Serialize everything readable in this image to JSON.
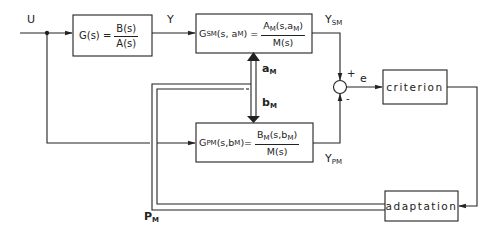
{
  "diagram": {
    "type": "block-diagram",
    "signals": {
      "input": "U",
      "plant_output": "Y",
      "sm_output_main": "Y",
      "sm_output_sub": "SM",
      "pm_output_main": "Y",
      "pm_output_sub": "PM",
      "error": "e",
      "param_a_main": "a",
      "param_a_sub": "M",
      "param_b_main": "b",
      "param_b_sub": "M",
      "param_p_main": "P",
      "param_p_sub": "M",
      "sum_plus": "+",
      "sum_minus": "-"
    },
    "blocks": {
      "plant": {
        "lhs": "G(s) =",
        "num": "B(s)",
        "den": "A(s)"
      },
      "series_model": {
        "lhs_main": "G",
        "lhs_sub": "SM",
        "lhs_args_pre": "(s, a",
        "lhs_args_sub": "M",
        "lhs_args_post": ") =",
        "num_main": "A",
        "num_sub": "M",
        "num_args_pre": "(s,a",
        "num_args_sub": "M",
        "num_args_post": ")",
        "den": "M(s)"
      },
      "parallel_model": {
        "lhs_main": "G",
        "lhs_sub": "PM",
        "lhs_args_pre": "(s,b",
        "lhs_args_sub": "M",
        "lhs_args_post": ")=",
        "num_main": "B",
        "num_sub": "M",
        "num_args_pre": "(s,b",
        "num_args_sub": "M",
        "num_args_post": ")",
        "den": "M(s)"
      },
      "criterion": {
        "label": "criterion"
      },
      "adaptation": {
        "label": "adaptation"
      }
    },
    "colors": {
      "line": "#222222",
      "background": "#ffffff"
    }
  }
}
